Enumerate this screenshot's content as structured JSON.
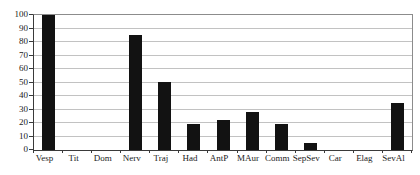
{
  "chart_data": {
    "type": "bar",
    "title": "",
    "xlabel": "",
    "ylabel": "",
    "categories": [
      "Vesp",
      "Tit",
      "Dom",
      "Nerv",
      "Traj",
      "Had",
      "AntP",
      "MAur",
      "Comm",
      "SepSev",
      "Car",
      "Elag",
      "SevAl"
    ],
    "values": [
      100,
      0,
      0,
      85,
      50,
      19,
      22,
      28,
      19,
      5,
      0,
      0,
      35
    ],
    "ylim": [
      0,
      100
    ],
    "yticks": [
      0,
      10,
      20,
      30,
      40,
      50,
      60,
      70,
      80,
      90,
      100
    ],
    "grid": true,
    "legend": false,
    "bar_color": "#121212",
    "gridline_color": "#c2c2c2",
    "axis_color": "#3a3a3a",
    "plot_border_color": "#8c8c8c",
    "tick_label_color": "#1a1a1a",
    "background_color": "#ffffff"
  }
}
